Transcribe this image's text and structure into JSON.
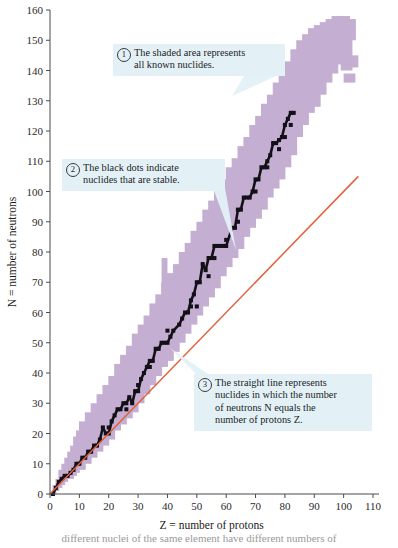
{
  "chart_data": {
    "type": "scatter",
    "title": "",
    "xlabel": "Z = number of protons",
    "ylabel": "N = number of neutrons",
    "xlim": [
      0,
      110
    ],
    "ylim": [
      0,
      160
    ],
    "xticks": [
      0,
      10,
      20,
      30,
      40,
      50,
      60,
      70,
      80,
      90,
      100,
      110
    ],
    "yticks": [
      0,
      10,
      20,
      30,
      40,
      50,
      60,
      70,
      80,
      90,
      100,
      110,
      120,
      130,
      140,
      150,
      160
    ],
    "grid": false,
    "legend_position": "none",
    "series": [
      {
        "name": "all known nuclides (shaded band)",
        "type": "area",
        "color": "#c4aed2",
        "z": [
          1,
          2,
          3,
          4,
          5,
          6,
          7,
          8,
          9,
          10,
          12,
          14,
          16,
          18,
          20,
          22,
          24,
          26,
          28,
          30,
          32,
          34,
          36,
          38,
          40,
          42,
          44,
          46,
          48,
          50,
          52,
          54,
          56,
          58,
          60,
          62,
          64,
          66,
          68,
          70,
          72,
          74,
          76,
          78,
          80,
          82,
          84,
          86,
          88,
          90,
          92,
          94,
          96,
          98,
          100,
          102
        ],
        "n_min": [
          0,
          1,
          2,
          3,
          4,
          5,
          5,
          6,
          7,
          8,
          10,
          12,
          14,
          16,
          18,
          21,
          23,
          25,
          27,
          30,
          33,
          36,
          39,
          42,
          44,
          47,
          50,
          53,
          56,
          59,
          62,
          65,
          68,
          72,
          75,
          78,
          81,
          85,
          88,
          91,
          94,
          98,
          101,
          104,
          108,
          112,
          118,
          122,
          126,
          128,
          132,
          136,
          139,
          142,
          146,
          150
        ],
        "n_max": [
          3,
          5,
          8,
          10,
          12,
          14,
          16,
          19,
          21,
          24,
          27,
          30,
          33,
          36,
          39,
          43,
          46,
          49,
          53,
          56,
          59,
          63,
          66,
          70,
          73,
          76,
          80,
          83,
          87,
          90,
          94,
          97,
          101,
          104,
          108,
          111,
          115,
          118,
          122,
          125,
          129,
          132,
          136,
          140,
          143,
          147,
          150,
          152,
          154,
          155,
          156,
          157,
          158,
          158,
          158,
          157
        ]
      },
      {
        "name": "stable nuclides (black dots)",
        "type": "scatter",
        "color": "#141018",
        "z": [
          1,
          2,
          3,
          4,
          5,
          6,
          7,
          8,
          9,
          10,
          11,
          12,
          13,
          14,
          15,
          16,
          17,
          18,
          19,
          20,
          21,
          22,
          23,
          24,
          25,
          26,
          27,
          28,
          29,
          30,
          31,
          32,
          33,
          34,
          35,
          36,
          37,
          38,
          39,
          40,
          41,
          42,
          44,
          45,
          46,
          47,
          48,
          49,
          50,
          51,
          52,
          53,
          54,
          55,
          56,
          57,
          58,
          59,
          60,
          62,
          63,
          64,
          65,
          66,
          67,
          68,
          69,
          70,
          71,
          72,
          73,
          74,
          75,
          76,
          77,
          78,
          79,
          80,
          81,
          82,
          83
        ],
        "n": [
          0,
          2,
          4,
          5,
          6,
          6,
          7,
          8,
          10,
          10,
          12,
          12,
          14,
          14,
          16,
          16,
          18,
          22,
          20,
          20,
          24,
          26,
          28,
          28,
          30,
          30,
          32,
          30,
          34,
          34,
          38,
          40,
          42,
          44,
          44,
          48,
          48,
          50,
          50,
          50,
          52,
          54,
          56,
          58,
          60,
          60,
          64,
          66,
          70,
          70,
          76,
          74,
          78,
          78,
          82,
          82,
          82,
          82,
          82,
          88,
          88,
          94,
          94,
          98,
          98,
          98,
          100,
          104,
          104,
          108,
          108,
          110,
          112,
          116,
          116,
          117,
          118,
          122,
          124,
          126,
          126
        ]
      },
      {
        "name": "N = Z line",
        "type": "line",
        "color": "#e1603a",
        "x": [
          0,
          105
        ],
        "y": [
          0,
          105
        ]
      }
    ]
  },
  "axes": {
    "x_label": "Z = number of protons",
    "y_label": "N = number of neutrons",
    "x_ticks": [
      "0",
      "10",
      "20",
      "30",
      "40",
      "50",
      "60",
      "70",
      "80",
      "90",
      "100",
      "110"
    ],
    "y_ticks": [
      "0",
      "10",
      "20",
      "30",
      "40",
      "50",
      "60",
      "70",
      "80",
      "90",
      "100",
      "110",
      "120",
      "130",
      "140",
      "150",
      "160"
    ]
  },
  "callouts": [
    {
      "number": "1",
      "text": "The shaded area represents all known nuclides.",
      "line1": "The shaded area represents",
      "line2": "all known nuclides."
    },
    {
      "number": "2",
      "text": "The black dots indicate nuclides that are stable.",
      "line1": "The black dots indicate",
      "line2": "nuclides that are stable."
    },
    {
      "number": "3",
      "text": "The straight line represents nuclides in which the number of neutrons N equals the number of protons Z.",
      "line1": "The straight line represents",
      "line2": "nuclides in which the number",
      "line3": "of neutrons N equals the",
      "line4": "number of protons Z."
    }
  ],
  "caption": {
    "partial_text": "different nuclei of the same element have different numbers of"
  },
  "colors": {
    "band": "#c4aed2",
    "stable": "#141018",
    "nz_line": "#e1603a",
    "callout_bg": "#e3f1f7",
    "axis": "#4a4a4a"
  }
}
